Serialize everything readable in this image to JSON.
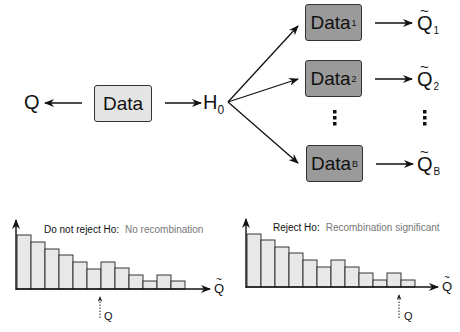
{
  "diagram": {
    "observed_statistic": "Q",
    "data_box": "Data",
    "null_hypothesis": "H",
    "null_hypothesis_sub": "0",
    "bootstrap": [
      {
        "label": "Data",
        "sub": "1",
        "stat": "Q",
        "stat_sub": "1"
      },
      {
        "label": "Data",
        "sub": "2",
        "stat": "Q",
        "stat_sub": "2"
      },
      {
        "label": "Data",
        "sub": "B",
        "stat": "Q",
        "stat_sub": "B"
      }
    ],
    "ellipsis": "⋮",
    "tilde": "~",
    "colors": {
      "main_box": "#e4e4e4",
      "bootstrap_box": "#9a9a9a",
      "bar_fill": "#e8e8e8",
      "stroke": "#222222"
    }
  },
  "panels": [
    {
      "title_bold": "Do not reject Ho:",
      "title_light": "No recombination",
      "x_axis_label": "Q",
      "marker_label": "Q"
    },
    {
      "title_bold": "Reject Ho:",
      "title_light": "Recombination significant",
      "x_axis_label": "Q",
      "marker_label": "Q"
    }
  ],
  "chart_data": [
    {
      "type": "bar",
      "title": "Do not reject Ho: No recombination",
      "xlabel": "Q̃ (bootstrap statistic)",
      "ylabel": "frequency",
      "categories": [
        "1",
        "2",
        "3",
        "4",
        "5",
        "6",
        "7",
        "8",
        "9",
        "10",
        "11",
        "12"
      ],
      "values": [
        54,
        47,
        40,
        34,
        27,
        20,
        27,
        21,
        14,
        8,
        14,
        8
      ],
      "observed_Q_bin": 7,
      "annotation": "Observed Q lies in the middle of the distribution"
    },
    {
      "type": "bar",
      "title": "Reject Ho: Recombination significant",
      "xlabel": "Q̃ (bootstrap statistic)",
      "ylabel": "frequency",
      "categories": [
        "1",
        "2",
        "3",
        "4",
        "5",
        "6",
        "7",
        "8",
        "9",
        "10",
        "11",
        "12"
      ],
      "values": [
        53,
        47,
        40,
        34,
        27,
        20,
        27,
        20,
        14,
        7,
        14,
        7
      ],
      "observed_Q_bin": 12,
      "annotation": "Observed Q lies in the upper tail of the distribution"
    }
  ]
}
